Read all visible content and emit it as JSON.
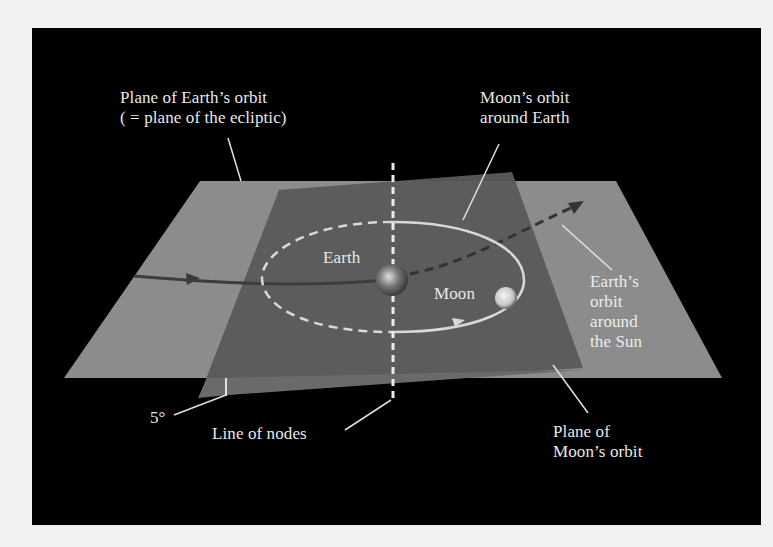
{
  "figure": {
    "background_color": "#000000",
    "page_color": "#f2f2f2",
    "ecliptic_plane_color": "#8c8c8c",
    "moon_plane_color": "#5a5a5a",
    "orbit_line_color": "#d9d9d9",
    "earth_path_color": "#3a3a3a"
  },
  "labels": {
    "ecliptic_plane": "Plane of Earth’s orbit\n( = plane of the ecliptic)",
    "moon_orbit": "Moon’s orbit\naround Earth",
    "earth": "Earth",
    "moon": "Moon",
    "earth_orbit_sun": "Earth’s\norbit\naround\nthe Sun",
    "inclination_angle": "5°",
    "line_of_nodes": "Line of nodes",
    "moon_plane": "Plane of\nMoon’s orbit"
  }
}
